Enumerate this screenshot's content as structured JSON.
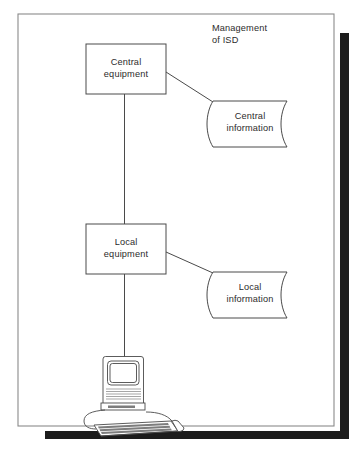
{
  "figure": {
    "title_line1": "Management",
    "title_line2": "of ISD",
    "frame": {
      "x": 18,
      "y": 14,
      "width": 316,
      "height": 412,
      "border_color": "#8a8a8a",
      "background": "#ffffff"
    },
    "shadow": {
      "color": "#1c1c1c",
      "right_bar": {
        "x": 340,
        "y": 33,
        "width": 9,
        "height": 405
      },
      "bottom_bar": {
        "x": 45,
        "y": 431,
        "width": 304,
        "height": 8
      }
    }
  },
  "nodes": [
    {
      "id": "central-equipment",
      "type": "process-box",
      "label_line1": "Central",
      "label_line2": "equipment",
      "x": 86,
      "y": 44,
      "width": 80,
      "height": 50
    },
    {
      "id": "central-information",
      "type": "data-document",
      "label_line1": "Central",
      "label_line2": "information",
      "x": 209,
      "y": 100,
      "width": 83,
      "height": 48
    },
    {
      "id": "local-equipment",
      "type": "process-box",
      "label_line1": "Local",
      "label_line2": "equipment",
      "x": 86,
      "y": 224,
      "width": 80,
      "height": 50
    },
    {
      "id": "local-information",
      "type": "data-document",
      "label_line1": "Local",
      "label_line2": "information",
      "x": 209,
      "y": 271,
      "width": 83,
      "height": 48
    },
    {
      "id": "workstation",
      "type": "computer-illustration",
      "label": "",
      "x": 78,
      "y": 356,
      "width": 100,
      "height": 72
    }
  ],
  "connectors": [
    {
      "id": "central-to-local",
      "from": "central-equipment",
      "to": "local-equipment",
      "shape": "vertical"
    },
    {
      "id": "central-to-central-information",
      "from": "central-equipment",
      "to": "central-information",
      "shape": "diagonal"
    },
    {
      "id": "local-to-workstation",
      "from": "local-equipment",
      "to": "workstation",
      "shape": "vertical"
    },
    {
      "id": "local-to-local-information",
      "from": "local-equipment",
      "to": "local-information",
      "shape": "diagonal"
    }
  ],
  "colors": {
    "line": "#4a4a4a",
    "text": "#2b2b2b",
    "frame": "#8a8a8a",
    "shadow": "#1c1c1c",
    "paper": "#ffffff"
  }
}
